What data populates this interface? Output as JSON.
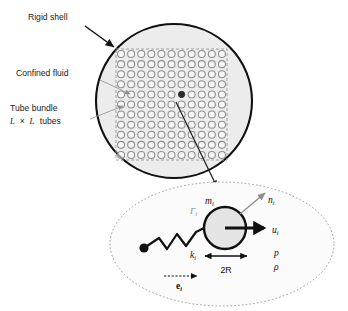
{
  "figure": {
    "canvas": {
      "width": 348,
      "height": 311,
      "background": "#ffffff"
    }
  },
  "colors": {
    "shell_stroke": "#111111",
    "shell_fill": "#ececec",
    "tube_stroke": "#8f8f8f",
    "bundle_dash": "#9a9a9a",
    "highlight_tube": "#2b2b2b",
    "leader_line": "#1a1a1a",
    "detail_border": "#9a9a9a",
    "detail_fill": "#fbfbfb",
    "circle_stroke": "#111111",
    "circle_fill": "#e4e4e4",
    "arrow_dark": "#111111",
    "arrow_gray": "#8d8d8d",
    "label_gray": "#8d8d8d",
    "text": "#1a1a1a"
  },
  "callouts": [
    {
      "id": "rigid-shell",
      "label": "Rigid shell",
      "x": 72,
      "y": 17,
      "anchor": "middle"
    },
    {
      "id": "confined-fluid",
      "label": "Confined fluid",
      "x": 63,
      "y": 73,
      "anchor": "middle"
    },
    {
      "id": "tube-bundle",
      "label": "Tube bundle",
      "x": 53,
      "y": 108,
      "anchor": "middle"
    }
  ],
  "tube_bundle_sub": {
    "id": "tube-bundle-size",
    "l_symbol": "L",
    "times": "×",
    "suffix": "tubes",
    "full": "L × L tubes",
    "x": 10,
    "y": 120
  },
  "shell": {
    "cx": 174,
    "cy": 101,
    "rx": 78,
    "ry": 77,
    "stroke_width": 2.1
  },
  "bundle": {
    "x": 116,
    "y": 49,
    "width": 111,
    "height": 111,
    "rows": 11,
    "cols": 11,
    "tube_radius": 3.5,
    "dash": "3,2",
    "highlight": {
      "row": 4,
      "col": 6
    }
  },
  "leader": {
    "from_x": 176,
    "from_y": 101,
    "to_x": 215,
    "to_y": 184
  },
  "detail": {
    "cx": 222,
    "cy": 244,
    "rx": 112,
    "ry": 62,
    "dash": "1.6,2.2"
  },
  "detail_circle": {
    "cx": 225,
    "cy": 228,
    "r": 21,
    "stroke_width": 2.4
  },
  "spring": {
    "anchor_x": 144,
    "anchor_y": 248,
    "anchor_r": 4.6,
    "points": "144,248 159,238 167,249 177,234 186,246 196,232 204,228"
  },
  "labels": {
    "mass": {
      "id": "mass-label",
      "base": "m",
      "sub": "i",
      "x": 207,
      "y": 201,
      "style": "italic-dark"
    },
    "normal": {
      "id": "normal-vector",
      "base": "n",
      "sub": "i",
      "x": 271,
      "y": 200,
      "style": "italic-dark"
    },
    "velocity": {
      "id": "velocity-label",
      "base": "u",
      "sub": "i",
      "x": 274,
      "y": 231,
      "style": "italic-dark"
    },
    "gamma": {
      "id": "gamma-label",
      "base": "Γ",
      "sub": "i",
      "x": 192,
      "y": 211,
      "style": "italic-gray"
    },
    "stiffness": {
      "id": "stiffness-label",
      "base": "k",
      "sub": "i",
      "x": 192,
      "y": 256,
      "style": "italic-dark"
    },
    "unit_vector": {
      "id": "unit-vector-label",
      "base": "e",
      "sub": "i",
      "x": 179,
      "y": 287,
      "style": "bold-dark"
    },
    "pressure": {
      "id": "pressure-label",
      "base": "p",
      "sub": "",
      "x": 275,
      "y": 254,
      "style": "italic-dark"
    },
    "density": {
      "id": "density-label",
      "base": "ρ",
      "sub": "",
      "x": 275,
      "y": 268,
      "style": "italic-dark"
    }
  },
  "diameter": {
    "id": "diameter-dimension",
    "label": "2R",
    "label_x": 225,
    "label_y": 271,
    "line_y": 256,
    "x1": 203,
    "x2": 248
  },
  "arrows": {
    "velocity": {
      "x1": 225,
      "y1": 228,
      "x2": 266,
      "y2": 228,
      "width": 3.0,
      "color": "dark"
    },
    "normal": {
      "x1": 240,
      "y1": 214,
      "x2": 266,
      "y2": 192,
      "width": 1.3,
      "color": "gray"
    },
    "unit_vector": {
      "x1": 164,
      "y1": 276,
      "x2": 199,
      "y2": 276,
      "width": 1.2,
      "color": "dark",
      "dashed": true
    }
  },
  "annotation_arrows": [
    {
      "id": "rigid-shell-arrow",
      "x1": 85,
      "y1": 26,
      "x2": 116,
      "y2": 48,
      "style": "solid-dark"
    },
    {
      "id": "confined-fluid-arrow",
      "x1": 100,
      "y1": 80,
      "x2": 131,
      "y2": 95,
      "style": "thin-gray"
    },
    {
      "id": "tube-bundle-arrow",
      "x1": 92,
      "y1": 118,
      "x2": 124,
      "y2": 106,
      "style": "thin-gray"
    }
  ]
}
